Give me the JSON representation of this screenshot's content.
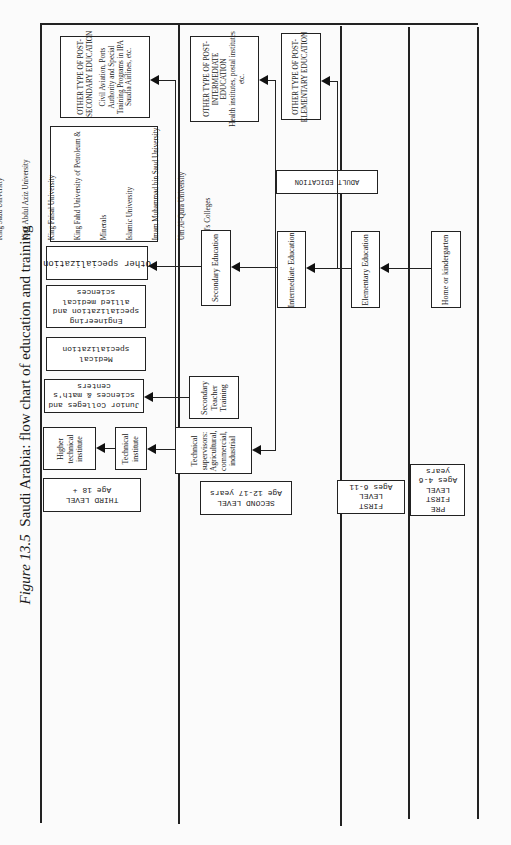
{
  "figure": {
    "label": "Figure 13.5",
    "title": "Saudi Arabia: flow chart of education and training"
  },
  "levels": [
    {
      "id": "third",
      "label_lines": [
        "THIRD LEVEL",
        "Age 18 +"
      ]
    },
    {
      "id": "second",
      "label_lines": [
        "SECOND LEVEL",
        "Age 12-17 years"
      ]
    },
    {
      "id": "first",
      "label_lines": [
        "FIRST",
        "LEVEL",
        "Ages 6-11"
      ]
    },
    {
      "id": "pre_first",
      "label_lines": [
        "PRE",
        "FIRST",
        "LEVEL",
        "Ages 4-6",
        "years"
      ]
    }
  ],
  "third_level": {
    "other_post_secondary": {
      "heading_lines": [
        "OTHER TYPE OF POST-",
        "SECONDARY EDUCATION"
      ],
      "body_lines": [
        "Civil Aviation, Ports",
        "Authority and Special",
        "Training Programs in IPA",
        "Saudia Airlines, etc."
      ]
    },
    "universities": [
      "King Saud University",
      "King Abdul Aziz University",
      "King Faisal University",
      "King Fahd University of Petroleum &",
      "Minerals",
      "Islamic University",
      "Imam Muhammad bin Saud University",
      "Um Al-Qura University",
      "Girl's Colleges"
    ],
    "other_specialization": "Other specialization",
    "engineering": [
      "Engineering",
      "specialization and",
      "allied medical",
      "sciences"
    ],
    "medical": [
      "Medical",
      "specialization"
    ],
    "junior_colleges": [
      "Junior Colleges and",
      "sciences & math's",
      "centers"
    ],
    "higher_technical": [
      "Higher",
      "technical",
      "institute"
    ],
    "technical_institute": [
      "Technical",
      "institute"
    ]
  },
  "second_level": {
    "other_post_intermediate": {
      "heading_lines": [
        "OTHER TYPE OF POST-",
        "INTERMEDIATE",
        "EDUCATION"
      ],
      "body_lines": [
        "Health institutes, postal institutes",
        "etc."
      ]
    },
    "secondary_education": "Secondary Education",
    "secondary_teacher_training": [
      "Secondary",
      "Teacher",
      "Training"
    ],
    "technical_supervisors": [
      "Technical",
      "supervisors:",
      "Agricultural,",
      "commercial,",
      "industrial"
    ],
    "intermediate_education": "Intermediate Education",
    "adult_education": "ADULT EDICATION"
  },
  "first_level": {
    "other_post_elementary": {
      "heading_lines": [
        "OTHER TYPE OF POST-",
        "ELEMENTARY EDUCATION"
      ]
    },
    "elementary_education": "Elementary Education"
  },
  "pre_first_level": {
    "home_kindergarten": "Home or kindergarten"
  }
}
